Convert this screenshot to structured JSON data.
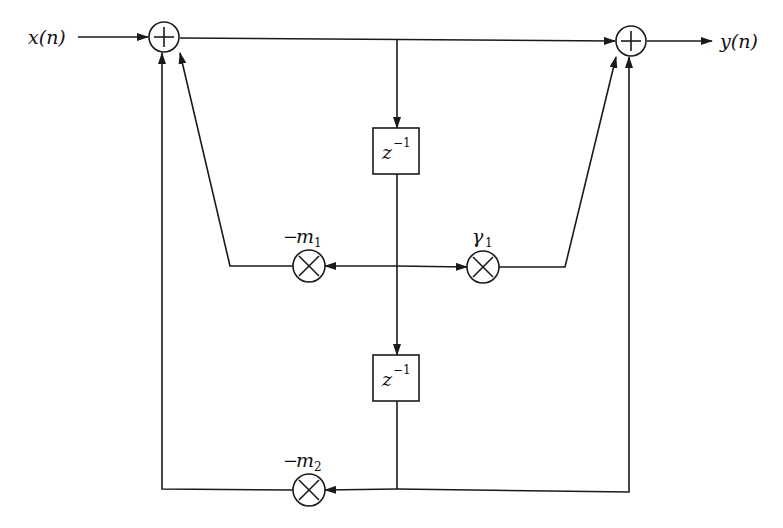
{
  "diagram": {
    "type": "signal-flow block diagram (second-order IIR lattice/feedback structure)",
    "input_label": "x(n)",
    "output_label": "y(n)",
    "adders": [
      {
        "id": "adder-input",
        "symbol": "+"
      },
      {
        "id": "adder-output",
        "symbol": "+"
      }
    ],
    "delays": [
      {
        "id": "delay-1",
        "base": "z",
        "exponent": "−1"
      },
      {
        "id": "delay-2",
        "base": "z",
        "exponent": "−1"
      }
    ],
    "multipliers": [
      {
        "id": "mult-m1",
        "symbol": "×",
        "coef_sign": "−",
        "coef_base": "m",
        "coef_sub": "1"
      },
      {
        "id": "mult-gamma1",
        "symbol": "×",
        "coef_sign": "",
        "coef_base": "γ",
        "coef_sub": "1"
      },
      {
        "id": "mult-m2",
        "symbol": "×",
        "coef_sign": "−",
        "coef_base": "m",
        "coef_sub": "2"
      }
    ]
  }
}
